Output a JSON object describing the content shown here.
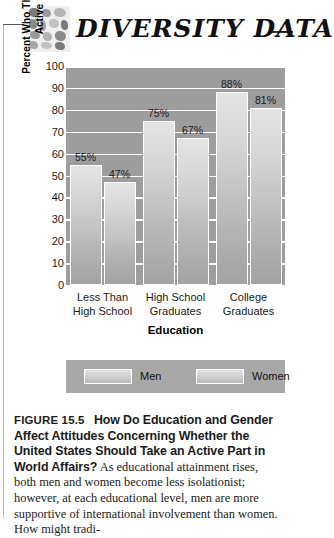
{
  "header": {
    "title": "DIVERSITY DATA",
    "logo_icon": "mosaic-tiles-icon"
  },
  "chart_data": {
    "type": "bar",
    "title": "",
    "categories": [
      "Less Than High School",
      "High School Graduates",
      "College Graduates"
    ],
    "category_lines": [
      [
        "Less Than",
        "High School"
      ],
      [
        "High School",
        "Graduates"
      ],
      [
        "College",
        "Graduates"
      ]
    ],
    "series": [
      {
        "name": "Men",
        "values": [
          55,
          75,
          88
        ],
        "labels": [
          "55%",
          "75%",
          "88%"
        ]
      },
      {
        "name": "Women",
        "values": [
          47,
          67,
          81
        ],
        "labels": [
          "47%",
          "67%",
          "81%"
        ]
      }
    ],
    "xlabel": "Education",
    "ylabel": "Percent Who Think the U.S. Should Take an Active Part in World Affairs",
    "ylim": [
      0,
      100
    ],
    "yticks": [
      100,
      90,
      80,
      70,
      60,
      50,
      40,
      30,
      20,
      10,
      0
    ],
    "grid": true,
    "legend_position": "bottom",
    "plot_bg_color": "#9d9d9d",
    "gridline_color": "#ffffff",
    "bar_outline_color": "#ffffff"
  },
  "legend": {
    "items": [
      {
        "label": "Men"
      },
      {
        "label": "Women"
      }
    ]
  },
  "caption": {
    "figure_number": "FIGURE 15.5",
    "title": "How Do Education and Gender Affect Attitudes Concerning Whether the United States Should Take an Active Part in World Affairs?",
    "body": "As educational attainment rises, both men and women become less isolationist; however, at each educational level, men are more supportive of international involvement than women. How might tradi-"
  }
}
